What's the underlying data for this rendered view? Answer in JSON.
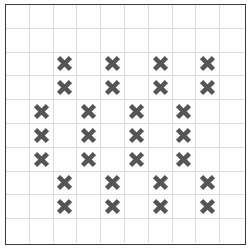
{
  "board": {
    "rows": 10,
    "cols": 10,
    "colors": {
      "mark": "#555555",
      "grid_line": "#dcdcdc",
      "border": "#3a3a3a",
      "background": "#ffffff"
    },
    "mark_symbol": "x-cross",
    "marks": [
      {
        "row": 2,
        "col": 2
      },
      {
        "row": 2,
        "col": 4
      },
      {
        "row": 2,
        "col": 6
      },
      {
        "row": 2,
        "col": 8
      },
      {
        "row": 3,
        "col": 2
      },
      {
        "row": 3,
        "col": 4
      },
      {
        "row": 3,
        "col": 6
      },
      {
        "row": 3,
        "col": 8
      },
      {
        "row": 4,
        "col": 1
      },
      {
        "row": 4,
        "col": 3
      },
      {
        "row": 4,
        "col": 5
      },
      {
        "row": 4,
        "col": 7
      },
      {
        "row": 5,
        "col": 1
      },
      {
        "row": 5,
        "col": 3
      },
      {
        "row": 5,
        "col": 5
      },
      {
        "row": 5,
        "col": 7
      },
      {
        "row": 6,
        "col": 1
      },
      {
        "row": 6,
        "col": 3
      },
      {
        "row": 6,
        "col": 5
      },
      {
        "row": 6,
        "col": 7
      },
      {
        "row": 7,
        "col": 2
      },
      {
        "row": 7,
        "col": 4
      },
      {
        "row": 7,
        "col": 6
      },
      {
        "row": 7,
        "col": 8
      },
      {
        "row": 8,
        "col": 2
      },
      {
        "row": 8,
        "col": 4
      },
      {
        "row": 8,
        "col": 6
      },
      {
        "row": 8,
        "col": 8
      }
    ]
  }
}
